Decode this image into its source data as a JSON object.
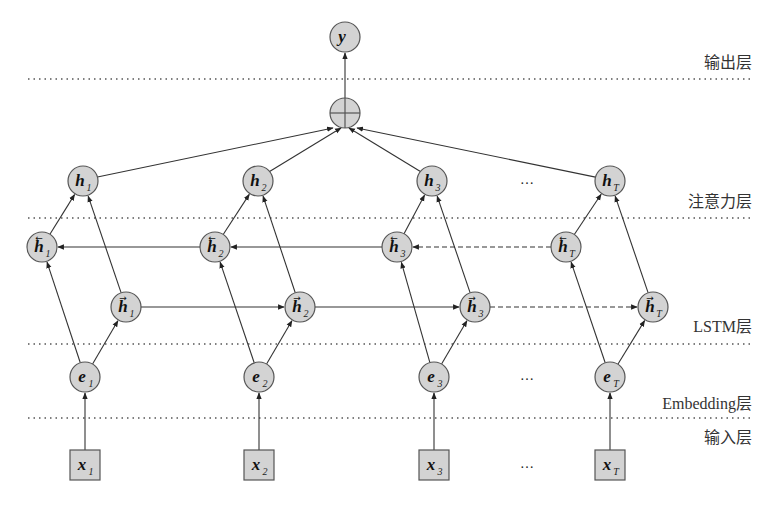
{
  "diagram": {
    "colors": {
      "node_fill": "#d3d3d3",
      "node_stroke": "#555555",
      "edge": "#333333",
      "divider": "#555555",
      "label": "#333333"
    },
    "layers": [
      {
        "id": "output",
        "label": "输出层"
      },
      {
        "id": "attention",
        "label": "注意力层"
      },
      {
        "id": "lstm",
        "label": "LSTM层"
      },
      {
        "id": "embedding",
        "label": "Embedding层"
      },
      {
        "id": "input",
        "label": "输入层"
      }
    ],
    "ellipsis": "…",
    "output_node": {
      "symbol": "y",
      "sub": ""
    },
    "sum_node": {
      "symbol": "⊕"
    },
    "timesteps": [
      {
        "sub": "1"
      },
      {
        "sub": "2"
      },
      {
        "sub": "3"
      },
      {
        "sub": "T"
      }
    ],
    "node_symbols": {
      "attention": "h",
      "backward": "h",
      "forward": "h",
      "embedding": "e",
      "input": "x"
    },
    "citation_fragment": "[2]"
  }
}
